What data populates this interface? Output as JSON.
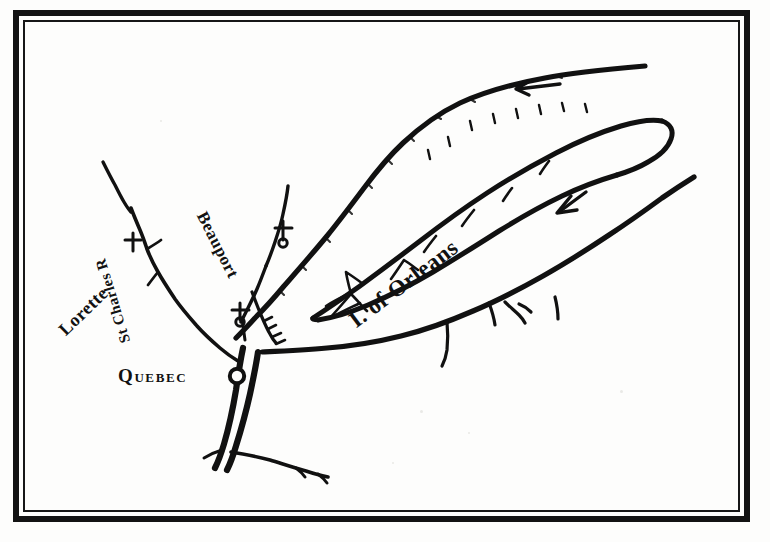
{
  "map": {
    "title": "I. of Orleans",
    "background_color": "#fdfdfc",
    "ink_color": "#111111",
    "labels": {
      "quebec": "Quebec",
      "lorette": "Lorette",
      "st_charles": "St Charles R",
      "beauport": "Beauport",
      "orleans": "I. of Orleans"
    },
    "markers": [
      {
        "name": "quebec-city-dot",
        "kind": "open-circle"
      },
      {
        "name": "lorette-cross",
        "kind": "cross"
      },
      {
        "name": "beauport-cross",
        "kind": "cross"
      },
      {
        "name": "montmorency-cross",
        "kind": "cross"
      }
    ],
    "arrows": [
      {
        "name": "north-channel-current-arrow",
        "direction": "left"
      },
      {
        "name": "south-channel-current-arrow",
        "direction": "down-left"
      }
    ],
    "features": [
      "St Lawrence River",
      "St Charles River",
      "North shore",
      "South shore",
      "Island of Orleans"
    ]
  }
}
